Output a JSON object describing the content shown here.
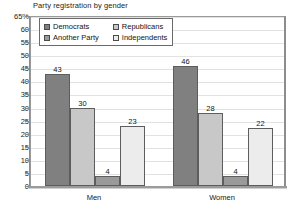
{
  "chart_data": {
    "type": "bar",
    "title": "Party registration by gender",
    "xlabel": "",
    "ylabel": "",
    "categories": [
      "Men",
      "Women"
    ],
    "series": [
      {
        "name": "Democrats",
        "values": [
          43,
          46
        ],
        "color": "#808080"
      },
      {
        "name": "Republicans",
        "values": [
          30,
          28
        ],
        "color": "#c8c8c8"
      },
      {
        "name": "Another Party",
        "values": [
          4,
          4
        ],
        "color": "#9a9a9a"
      },
      {
        "name": "Independents",
        "values": [
          23,
          22
        ],
        "color": "#ececec"
      }
    ],
    "ylim": [
      0,
      65
    ],
    "ytick_step": 5,
    "ytick_labels": [
      "65%",
      "60",
      "55",
      "50",
      "45",
      "40",
      "35",
      "30",
      "25",
      "20",
      "15",
      "10",
      "5",
      "0"
    ],
    "ytick_values": [
      65,
      60,
      55,
      50,
      45,
      40,
      35,
      30,
      25,
      20,
      15,
      10,
      5,
      0
    ],
    "grid": true,
    "legend_position": "top-left",
    "data_labels": true
  },
  "axis": {
    "line_color": "#8d8d8d",
    "grid_color": "#e2e2e2"
  }
}
